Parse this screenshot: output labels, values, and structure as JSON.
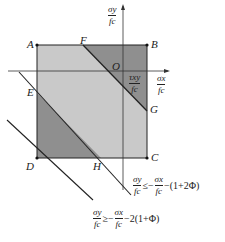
{
  "figure": {
    "points": {
      "A": "A",
      "B": "B",
      "C": "C",
      "D": "D",
      "E": "E",
      "F": "F",
      "G": "G",
      "H": "H",
      "O": "O"
    },
    "axes": {
      "y_axis": {
        "num": "σy",
        "den": "fc"
      },
      "x_axis": {
        "num": "σx",
        "den": "fc"
      },
      "shear": {
        "num": "τxy",
        "den": "fc"
      }
    },
    "inequalities": [
      {
        "lhs_num": "σy",
        "lhs_den": "fc",
        "op": "≤−",
        "rhs_num": "σx",
        "rhs_den": "fc",
        "tail": "−(1+2Φ)"
      },
      {
        "lhs_num": "σy",
        "lhs_den": "fc",
        "op": "≥−",
        "rhs_num": "σx",
        "rhs_den": "fc",
        "tail": "−2(1+Φ)"
      }
    ],
    "colors": {
      "light_fill": "#c8c8c8",
      "dark_fill": "#8e8e8e",
      "line": "#222222"
    }
  }
}
